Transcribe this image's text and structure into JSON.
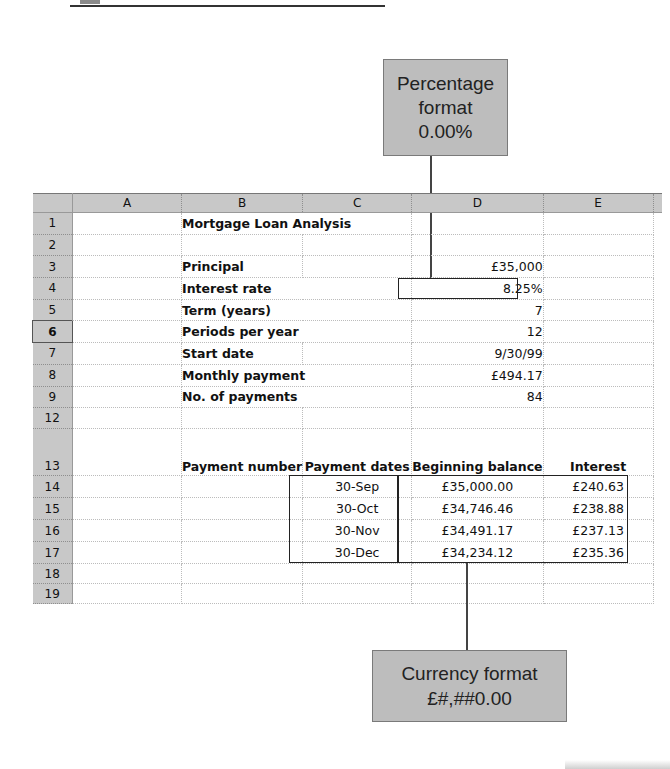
{
  "decor": {
    "top_rule": true
  },
  "callouts": {
    "percentage": {
      "lines": [
        "Percentage",
        "format",
        "0.00%"
      ],
      "target_cell": "D4"
    },
    "currency": {
      "lines": [
        "Currency format",
        "£#,##0.00"
      ],
      "target_range": "C14:E17"
    }
  },
  "sheet": {
    "columns": [
      "A",
      "B",
      "C",
      "D",
      "E"
    ],
    "selected_row": "6",
    "rows": [
      {
        "num": "1",
        "b": "Mortgage Loan Analysis",
        "c": "",
        "d": "",
        "e": ""
      },
      {
        "num": "2",
        "b": "",
        "c": "",
        "d": "",
        "e": ""
      },
      {
        "num": "3",
        "b": "Principal",
        "c": "",
        "d": "£35,000",
        "e": ""
      },
      {
        "num": "4",
        "b": "Interest rate",
        "c": "",
        "d": "8.25%",
        "e": ""
      },
      {
        "num": "5",
        "b": "Term (years)",
        "c": "",
        "d": "7",
        "e": ""
      },
      {
        "num": "6",
        "b": "Periods per year",
        "c": "",
        "d": "12",
        "e": ""
      },
      {
        "num": "7",
        "b": "Start date",
        "c": "",
        "d": "9/30/99",
        "e": ""
      },
      {
        "num": "8",
        "b": "Monthly payment",
        "c": "",
        "d": "£494.17",
        "e": ""
      },
      {
        "num": "9",
        "b": "No. of payments",
        "c": "",
        "d": "84",
        "e": ""
      },
      {
        "num": "12",
        "b": "",
        "c": "",
        "d": "",
        "e": ""
      },
      {
        "num": "13",
        "b": "Payment number",
        "c": "Payment dates",
        "d": "Beginning balance",
        "e": "Interest"
      },
      {
        "num": "14",
        "b": "",
        "c": "30-Sep",
        "d": "£35,000.00",
        "e": "£240.63"
      },
      {
        "num": "15",
        "b": "",
        "c": "30-Oct",
        "d": "£34,746.46",
        "e": "£238.88"
      },
      {
        "num": "16",
        "b": "",
        "c": "30-Nov",
        "d": "£34,491.17",
        "e": "£237.13"
      },
      {
        "num": "17",
        "b": "",
        "c": "30-Dec",
        "d": "£34,234.12",
        "e": "£235.36"
      },
      {
        "num": "18",
        "b": "",
        "c": "",
        "d": "",
        "e": ""
      },
      {
        "num": "19",
        "b": "",
        "c": "",
        "d": "",
        "e": ""
      }
    ]
  },
  "colors": {
    "header_gray": "#c8c8c8",
    "callout_gray": "#bdbdbd",
    "border_dark": "#222222"
  }
}
